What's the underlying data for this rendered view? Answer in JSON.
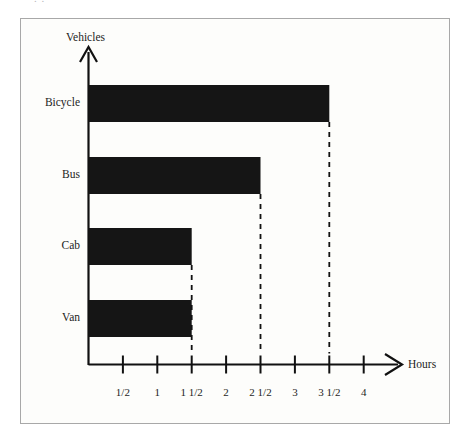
{
  "page": {
    "background_color": "#ffffff",
    "frame_color": "#a8a8a8",
    "bar_color": "#151515",
    "axis_color": "#111111",
    "top_bleed_text": "     .                                                  ."
  },
  "chart_data": {
    "type": "bar",
    "orientation": "horizontal",
    "title": "",
    "subtitle": "",
    "xlabel": "Hours",
    "ylabel": "Vehicles",
    "categories": [
      "Bicycle",
      "Bus",
      "Cab",
      "Van"
    ],
    "values": [
      3.5,
      2.5,
      1.5,
      1.5
    ],
    "value_labels": [
      "3 1/2",
      "2 1/2",
      "1 1/2",
      "1 1/2"
    ],
    "xlim": [
      0,
      4.35
    ],
    "ylim": [
      0,
      4
    ],
    "xticks": [
      0.5,
      1,
      1.5,
      2,
      2.5,
      3,
      3.5,
      4
    ],
    "xtick_labels": [
      "1/2",
      "1",
      "1 1/2",
      "2",
      "2 1/2",
      "3",
      "3 1/2",
      "4"
    ],
    "grid": false,
    "legend": null,
    "annotations": [
      {
        "type": "dropline",
        "style": "dashed",
        "at_x": 1.5
      },
      {
        "type": "dropline",
        "style": "dashed",
        "at_x": 2.5
      },
      {
        "type": "dropline",
        "style": "dashed",
        "at_x": 3.5
      }
    ],
    "axis_arrows": {
      "x": "right-arrow",
      "y": "up-arrow"
    }
  }
}
